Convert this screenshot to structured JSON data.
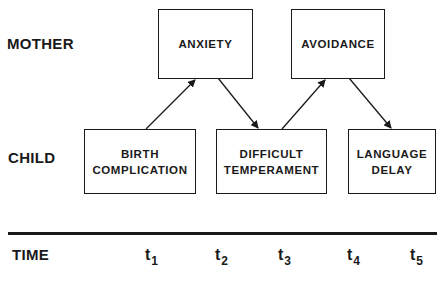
{
  "rows": {
    "mother": "MOTHER",
    "child": "CHILD",
    "time": "TIME"
  },
  "boxes": {
    "anxiety": "ANXIETY",
    "avoidance": "AVOIDANCE",
    "birth_complication": "BIRTH\nCOMPLICATION",
    "difficult_temperament": "DIFFICULT\nTEMPERAMENT",
    "language_delay": "LANGUAGE\nDELAY"
  },
  "time_points": [
    {
      "base": "t",
      "sub": "1"
    },
    {
      "base": "t",
      "sub": "2"
    },
    {
      "base": "t",
      "sub": "3"
    },
    {
      "base": "t",
      "sub": "4"
    },
    {
      "base": "t",
      "sub": "5"
    }
  ],
  "edges": [
    {
      "from": "BIRTH COMPLICATION",
      "to": "ANXIETY"
    },
    {
      "from": "ANXIETY",
      "to": "DIFFICULT TEMPERAMENT"
    },
    {
      "from": "DIFFICULT TEMPERAMENT",
      "to": "AVOIDANCE"
    },
    {
      "from": "AVOIDANCE",
      "to": "LANGUAGE DELAY"
    }
  ]
}
